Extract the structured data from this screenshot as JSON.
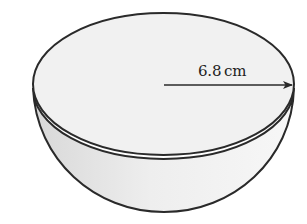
{
  "figure": {
    "type": "hemisphere-bowl",
    "radius_label": "6.8 cm",
    "radius_value": 6.8,
    "radius_unit": "cm"
  },
  "colors": {
    "background": "#ffffff",
    "outline": "#2a2a2a",
    "rim_fill": "#f1f1f1",
    "bowl_fill_light": "#f6f6f6",
    "bowl_fill_dark": "#dcdcdc"
  }
}
